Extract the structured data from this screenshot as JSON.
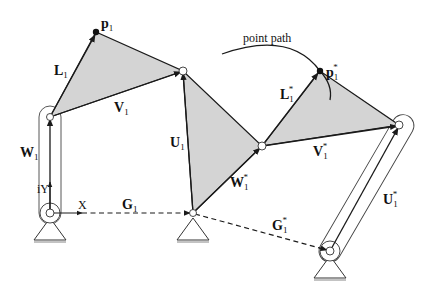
{
  "diagram": {
    "type": "planar linkage mechanism (two positions)",
    "annotation": "point path",
    "labels": {
      "p1": {
        "base": "p",
        "sub": "1",
        "star": ""
      },
      "p1s": {
        "base": "p",
        "sub": "1",
        "star": "*"
      },
      "L1": {
        "base": "L",
        "sub": "1",
        "star": ""
      },
      "L1s": {
        "base": "L",
        "sub": "1",
        "star": "*"
      },
      "V1": {
        "base": "V",
        "sub": "1",
        "star": ""
      },
      "V1s": {
        "base": "V",
        "sub": "1",
        "star": "*"
      },
      "W1": {
        "base": "W",
        "sub": "1",
        "star": ""
      },
      "W1s": {
        "base": "W",
        "sub": "1",
        "star": "*"
      },
      "U1": {
        "base": "U",
        "sub": "1",
        "star": ""
      },
      "U1s": {
        "base": "U",
        "sub": "1",
        "star": "*"
      },
      "G1": {
        "base": "G",
        "sub": "1",
        "star": ""
      },
      "G1s": {
        "base": "G",
        "sub": "1",
        "star": "*"
      },
      "X": "X",
      "iY": "iY"
    },
    "points": {
      "ground_left": [
        50,
        213
      ],
      "joint_left": [
        50,
        117
      ],
      "p1": [
        96,
        32
      ],
      "joint_top": [
        183,
        71
      ],
      "ground_mid": [
        193,
        213
      ],
      "joint_mid": [
        262,
        146
      ],
      "p1s": [
        320,
        71
      ],
      "joint_right": [
        399,
        125
      ],
      "ground_right": [
        330,
        251
      ]
    },
    "colors": {
      "fill": "#d4d4d4",
      "line": "#1a1a1a"
    }
  }
}
